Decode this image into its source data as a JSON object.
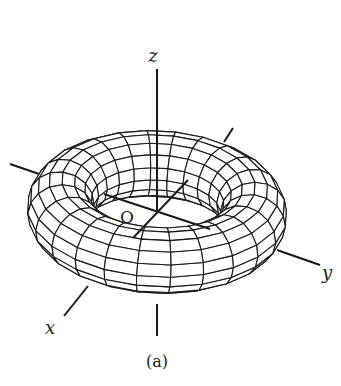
{
  "figure": {
    "caption": "(a)",
    "labels": {
      "z": "z",
      "x": "x",
      "y": "y",
      "origin": "O"
    }
  },
  "geometry": {
    "center": [
      157,
      212
    ],
    "major_radius_px": 97,
    "minor_radius_px": 33,
    "tilt_deg": 30,
    "roll_deg": 3,
    "meridian_segments": 24,
    "tube_segments": 16,
    "line_color": "#1a1a1a",
    "fill_color": "#ffffff"
  },
  "axes": {
    "z_top": [
      [
        157,
        69
      ],
      [
        157,
        212
      ]
    ],
    "z_bottom": [
      [
        157,
        304
      ],
      [
        157,
        336
      ]
    ],
    "neg_y": [
      [
        10,
        164
      ],
      [
        42,
        175
      ]
    ],
    "pos_y": [
      [
        277,
        250
      ],
      [
        320,
        265
      ]
    ],
    "neg_x": [
      [
        233,
        128
      ],
      [
        224,
        142
      ]
    ],
    "pos_x": [
      [
        88,
        286
      ],
      [
        64,
        316
      ]
    ],
    "inner_y": [
      [
        104,
        194
      ],
      [
        210,
        229
      ]
    ],
    "inner_x": [
      [
        188,
        180
      ],
      [
        133,
        238
      ]
    ]
  },
  "label_positions": {
    "z": [
      153,
      62
    ],
    "x": [
      50,
      334
    ],
    "y": [
      327,
      279
    ],
    "origin": [
      127,
      223
    ],
    "caption": [
      157,
      367
    ]
  }
}
